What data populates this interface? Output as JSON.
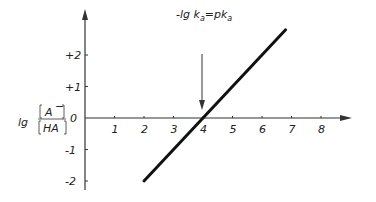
{
  "chart_data": {
    "type": "line",
    "title": "",
    "xlabel": "",
    "ylabel": "lg [A-]/[HA]",
    "x_ticks": [
      "1",
      "2",
      "3",
      "4",
      "5",
      "6",
      "7",
      "8"
    ],
    "y_ticks": [
      "+2",
      "+1",
      "0",
      "-1",
      "-2"
    ],
    "xlim": [
      0,
      9.5
    ],
    "ylim": [
      -2.5,
      3
    ],
    "series": [
      {
        "name": "lg([A-]/[HA]) vs pH",
        "x": [
          2,
          6.8
        ],
        "y": [
          -2,
          2.8
        ]
      }
    ],
    "annotations": [
      {
        "text": "-lg k_a = pk_a",
        "x": 4,
        "y": 0,
        "arrow": true
      }
    ],
    "grid": false
  },
  "labels": {
    "ylabel_prefix": "lg",
    "ylabel_num": "A",
    "ylabel_den": "HA",
    "annotation_a": "-lg k",
    "annotation_b": "=pk",
    "annotation_sub": "a",
    "origin": "0"
  }
}
